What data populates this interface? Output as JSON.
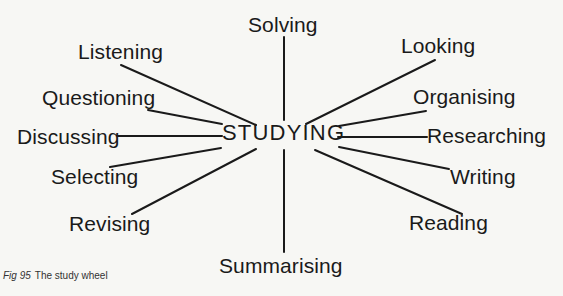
{
  "diagram": {
    "type": "spoke-wheel",
    "hub": {
      "label": "STUDYING",
      "x": 222,
      "y": 122
    },
    "spokes": [
      {
        "id": "solving",
        "label": "Solving",
        "label_x": 248,
        "label_y": 14,
        "line": [
          284,
          37,
          284,
          120
        ]
      },
      {
        "id": "listening",
        "label": "Listening",
        "label_x": 78,
        "label_y": 41,
        "line": [
          121,
          65,
          256,
          125
        ]
      },
      {
        "id": "questioning",
        "label": "Questioning",
        "label_x": 42,
        "label_y": 87,
        "line": [
          148,
          110,
          222,
          124
        ]
      },
      {
        "id": "discussing",
        "label": "Discussing",
        "label_x": 17,
        "label_y": 126,
        "line": [
          118,
          136,
          222,
          136
        ]
      },
      {
        "id": "selecting",
        "label": "Selecting",
        "label_x": 51,
        "label_y": 166,
        "line": [
          110,
          167,
          221,
          148
        ]
      },
      {
        "id": "revising",
        "label": "Revising",
        "label_x": 69,
        "label_y": 213,
        "line": [
          132,
          214,
          256,
          149
        ]
      },
      {
        "id": "summarising",
        "label": "Summarising",
        "label_x": 219,
        "label_y": 255,
        "line": [
          284,
          150,
          284,
          252
        ]
      },
      {
        "id": "looking",
        "label": "Looking",
        "label_x": 401,
        "label_y": 35,
        "line": [
          306,
          124,
          435,
          60
        ]
      },
      {
        "id": "organising",
        "label": "Organising",
        "label_x": 413,
        "label_y": 86,
        "line": [
          339,
          126,
          426,
          111
        ]
      },
      {
        "id": "researching",
        "label": "Researching",
        "label_x": 427,
        "label_y": 125,
        "line": [
          338,
          137,
          427,
          137
        ]
      },
      {
        "id": "writing",
        "label": "Writing",
        "label_x": 450,
        "label_y": 166,
        "line": [
          339,
          147,
          449,
          169
        ]
      },
      {
        "id": "reading",
        "label": "Reading",
        "label_x": 409,
        "label_y": 212,
        "line": [
          315,
          150,
          462,
          214
        ]
      }
    ]
  },
  "caption": {
    "figure_number": "Fig 95",
    "title": "The study wheel"
  },
  "colors": {
    "background": "#f7f7f4",
    "ink": "#1a1a1a"
  }
}
